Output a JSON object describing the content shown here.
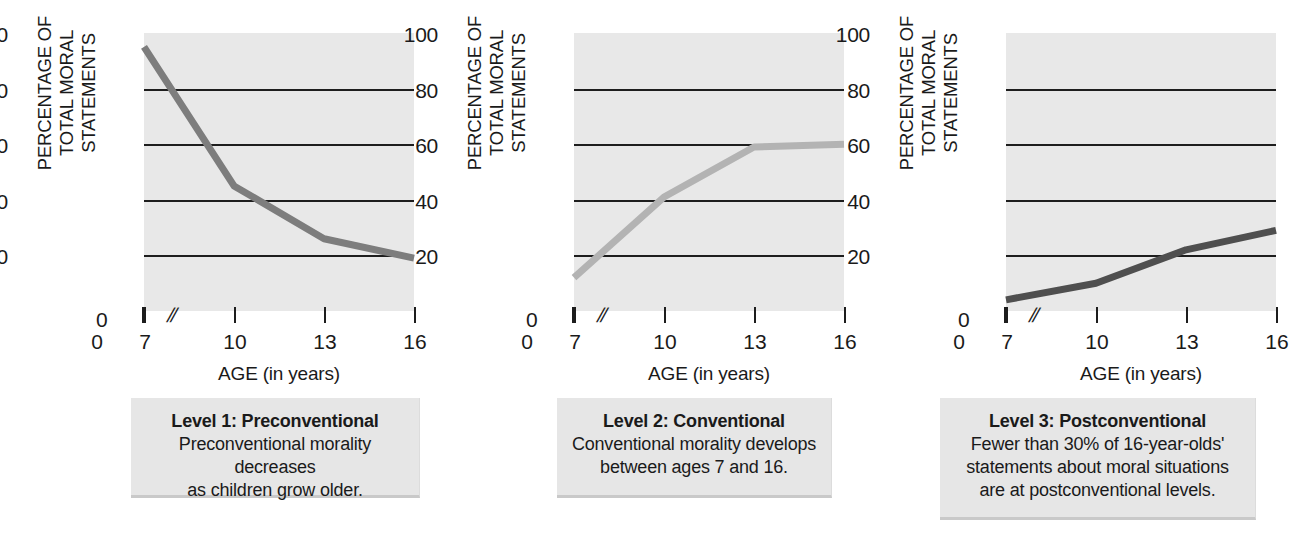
{
  "figure": {
    "background": "#ffffff",
    "plot_background": "#e8e8e8",
    "gridline_color": "#1d1d1d"
  },
  "axes": {
    "y_title_line1": "PERCENTAGE OF",
    "y_title_line2": "TOTAL MORAL STATEMENTS",
    "x_title": "AGE (in years)",
    "y_ticks": [
      "100",
      "80",
      "60",
      "40",
      "20"
    ],
    "zero_label": "0",
    "axis_break_symbol": "//",
    "x_ticks": [
      "0",
      "7",
      "10",
      "13",
      "16"
    ]
  },
  "captions": [
    {
      "title": "Level 1: Preconventional",
      "body": "Preconventional morality decreases\nas children grow older."
    },
    {
      "title": "Level 2: Conventional",
      "body": "Conventional morality develops\nbetween ages 7 and 16."
    },
    {
      "title": "Level 3: Postconventional",
      "body": "Fewer than 30% of 16-year-olds'\nstatements about moral situations\nare at postconventional levels."
    }
  ],
  "chart_data": [
    {
      "type": "line",
      "title": "Level 1: Preconventional",
      "xlabel": "AGE (in years)",
      "ylabel": "PERCENTAGE OF TOTAL MORAL STATEMENTS",
      "x": [
        7,
        10,
        13,
        16
      ],
      "values": [
        95,
        45,
        26,
        19
      ],
      "xlim": [
        7,
        16
      ],
      "ylim": [
        0,
        100
      ],
      "x_ticks": [
        0,
        7,
        10,
        13,
        16
      ],
      "y_ticks": [
        0,
        20,
        40,
        60,
        80,
        100
      ],
      "grid": "horizontal",
      "axis_break": true,
      "line_color": "#7d7d7d",
      "line_width": 7,
      "legend": "none"
    },
    {
      "type": "line",
      "title": "Level 2: Conventional",
      "xlabel": "AGE (in years)",
      "ylabel": "PERCENTAGE OF TOTAL MORAL STATEMENTS",
      "x": [
        7,
        10,
        13,
        16
      ],
      "values": [
        12,
        41,
        59,
        60
      ],
      "xlim": [
        7,
        16
      ],
      "ylim": [
        0,
        100
      ],
      "x_ticks": [
        0,
        7,
        10,
        13,
        16
      ],
      "y_ticks": [
        0,
        20,
        40,
        60,
        80,
        100
      ],
      "grid": "horizontal",
      "axis_break": true,
      "line_color": "#b3b3b3",
      "line_width": 7,
      "legend": "none"
    },
    {
      "type": "line",
      "title": "Level 3: Postconventional",
      "xlabel": "AGE (in years)",
      "ylabel": "PERCENTAGE OF TOTAL MORAL STATEMENTS",
      "x": [
        7,
        10,
        13,
        16
      ],
      "values": [
        4,
        10,
        22,
        29
      ],
      "xlim": [
        7,
        16
      ],
      "ylim": [
        0,
        100
      ],
      "x_ticks": [
        0,
        7,
        10,
        13,
        16
      ],
      "y_ticks": [
        0,
        20,
        40,
        60,
        80,
        100
      ],
      "grid": "horizontal",
      "axis_break": true,
      "line_color": "#4f4f4f",
      "line_width": 7,
      "legend": "none"
    }
  ]
}
